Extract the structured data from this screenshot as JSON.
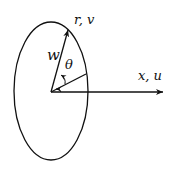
{
  "diagram": {
    "labels": {
      "radial_axis": "r,  v",
      "horizontal_axis": "x,  u",
      "vector": "w",
      "angle": "θ"
    },
    "colors": {
      "stroke": "#111111",
      "background": "#ffffff"
    }
  }
}
